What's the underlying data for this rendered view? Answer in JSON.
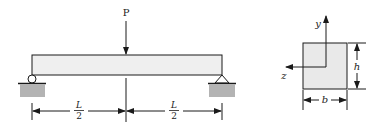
{
  "beam": {
    "load_label": "P",
    "left_support": "roller",
    "right_support": "pin",
    "dimensions": [
      {
        "numerator": "L",
        "denominator": "2"
      },
      {
        "numerator": "L",
        "denominator": "2"
      }
    ]
  },
  "cross_section": {
    "shape": "rectangle",
    "axis_y_label": "y",
    "axis_z_label": "z",
    "height_label": "h",
    "width_label": "b"
  },
  "colors": {
    "line": "#1a1a1a",
    "beam_fill": "#efefef",
    "ground_fill": "#b3b3b3",
    "section_fill": "#e9e9e9"
  }
}
